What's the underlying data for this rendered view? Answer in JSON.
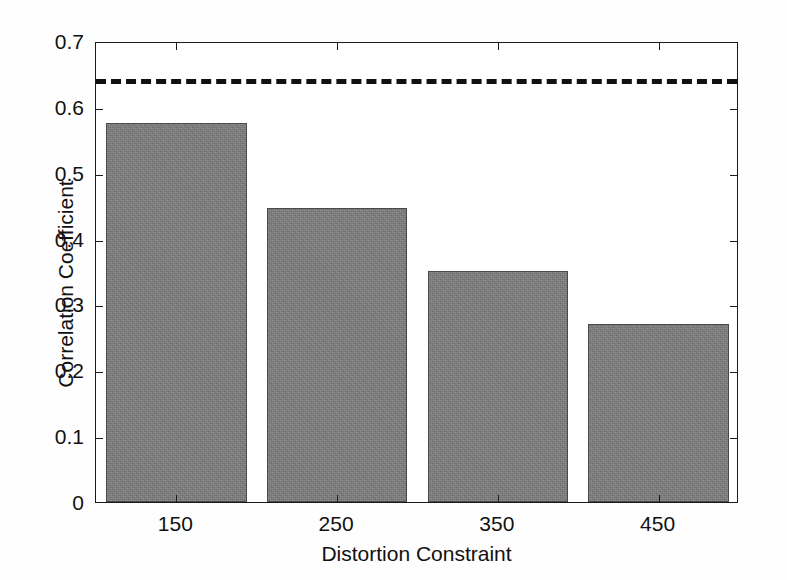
{
  "chart_data": {
    "type": "bar",
    "title": "",
    "xlabel": "Distortion Constraint",
    "ylabel": "Correlation Coefficient",
    "categories": [
      "150",
      "250",
      "350",
      "450"
    ],
    "values": [
      0.575,
      0.447,
      0.351,
      0.27
    ],
    "ylim": [
      0,
      0.7
    ],
    "ytick_values": [
      0,
      0.1,
      0.2,
      0.3,
      0.4,
      0.5,
      0.6,
      0.7
    ],
    "ytick_labels": [
      "0",
      "0.1",
      "0.2",
      "0.3",
      "0.4",
      "0.5",
      "0.6",
      "0.7"
    ],
    "grid": false,
    "legend": "none",
    "series": [
      {
        "name": "Correlation Coefficient",
        "values": [
          0.575,
          0.447,
          0.351,
          0.27
        ],
        "color": "#7d7d7d",
        "edge_color": "#4a4a4a"
      }
    ],
    "reference_lines": [
      {
        "name": "threshold",
        "orientation": "horizontal",
        "value": 0.645,
        "style": "dashed",
        "color": "#111111"
      }
    ],
    "axis_box": true,
    "tick_direction": "in"
  },
  "axes": {
    "frame_color": "#1a1a1a"
  }
}
